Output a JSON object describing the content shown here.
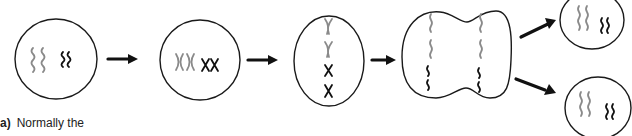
{
  "diagram": {
    "stages": [
      {
        "id": "interphase",
        "description": "cell with uncondensed chromosomes (2 gray, 2 black)"
      },
      {
        "id": "prophase",
        "description": "condensed duplicated chromosomes (2 gray X, 2 black X)"
      },
      {
        "id": "metaphase",
        "description": "chromosomes aligned vertically at center"
      },
      {
        "id": "anaphase-telophase",
        "description": "pinching cell with chromatids separated to each side"
      },
      {
        "id": "daughter-cells",
        "description": "two daughter cells, each with 2 gray and 2 black chromosomes"
      }
    ],
    "colors": {
      "maternal_chromosome": "#8a8a8a",
      "paternal_chromosome": "#111111",
      "outline": "#1a1a1a"
    }
  },
  "caption": {
    "label": "a)",
    "text": "Normally the"
  }
}
